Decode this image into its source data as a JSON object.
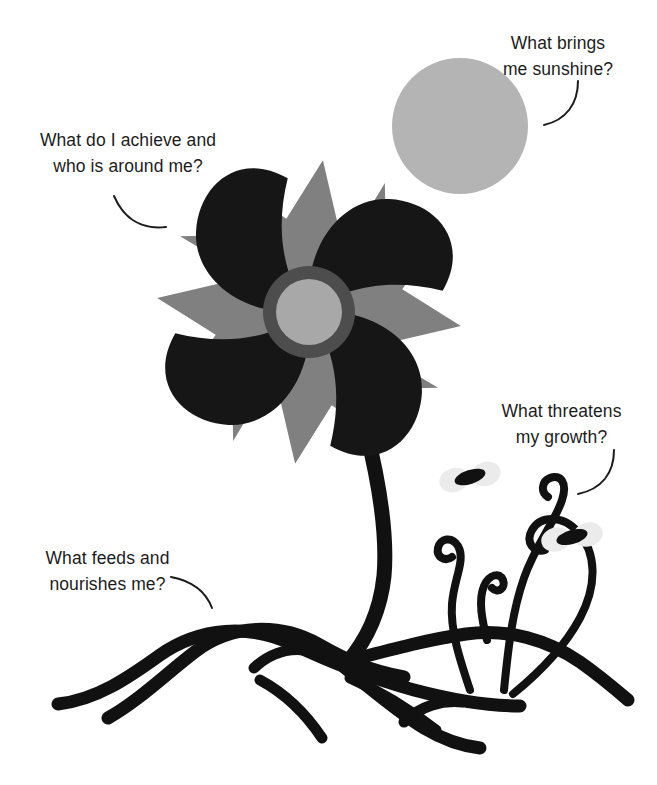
{
  "diagram": {
    "background_color": "#ffffff"
  },
  "captions": {
    "sunshine": {
      "text": "What brings\nme sunshine?",
      "points_to": "sun"
    },
    "achieve": {
      "text": "What do I achieve and\nwho is around me?",
      "points_to": "flower"
    },
    "threatens": {
      "text": "What threatens\nmy growth?",
      "points_to": "weeds"
    },
    "feeds": {
      "text": "What feeds and\nnourishes me?",
      "points_to": "roots"
    }
  },
  "elements": {
    "sun": {
      "label": "sun",
      "color": "#b4b4b4",
      "center_x": 460,
      "center_y": 126,
      "radius": 68
    },
    "flower": {
      "label": "flower",
      "petal_color": "#161616",
      "sepal_color": "#808080",
      "center_ring_color": "#4d4d4d",
      "center_fill_color": "#a8a8a8",
      "center_x": 309,
      "center_y": 312,
      "petal_count": 4,
      "sepal_count": 8
    },
    "stem": {
      "label": "stem",
      "color": "#111111"
    },
    "roots": {
      "label": "roots",
      "color": "#111111",
      "strand_count": 6
    },
    "weeds": {
      "label": "weeds",
      "color": "#111111",
      "strand_count": 3
    },
    "insects": {
      "label": "insects",
      "body_color": "#111111",
      "wing_color": "#e8e8e8",
      "count": 2
    }
  },
  "colors": {
    "ink": "#1c1c1c",
    "gray_mid": "#808080",
    "gray_light": "#b4b4b4",
    "gray_pale": "#e8e8e8",
    "black": "#111111"
  }
}
